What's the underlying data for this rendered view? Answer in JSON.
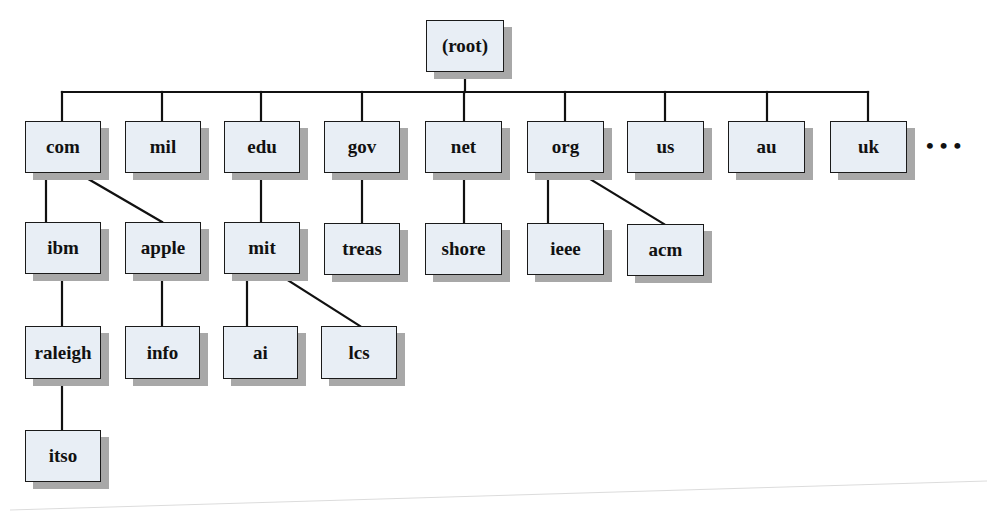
{
  "diagram": {
    "ellipsis": "•••",
    "colors": {
      "box_fill": "#e8eef5",
      "box_border": "#1a1a1a",
      "shadow": "#a8a8a8",
      "line": "#111111"
    },
    "nodes": [
      {
        "id": "root",
        "label": "(root)",
        "x": 426,
        "y": 20,
        "w": 78,
        "h": 52
      },
      {
        "id": "com",
        "label": "com",
        "x": 25,
        "y": 121,
        "w": 76,
        "h": 52
      },
      {
        "id": "mil",
        "label": "mil",
        "x": 125,
        "y": 121,
        "w": 76,
        "h": 52
      },
      {
        "id": "edu",
        "label": "edu",
        "x": 224,
        "y": 121,
        "w": 76,
        "h": 52
      },
      {
        "id": "gov",
        "label": "gov",
        "x": 324,
        "y": 121,
        "w": 76,
        "h": 52
      },
      {
        "id": "net",
        "label": "net",
        "x": 425,
        "y": 121,
        "w": 77,
        "h": 52
      },
      {
        "id": "org",
        "label": "org",
        "x": 527,
        "y": 121,
        "w": 77,
        "h": 52
      },
      {
        "id": "us",
        "label": "us",
        "x": 627,
        "y": 121,
        "w": 77,
        "h": 52
      },
      {
        "id": "au",
        "label": "au",
        "x": 728,
        "y": 121,
        "w": 77,
        "h": 52
      },
      {
        "id": "uk",
        "label": "uk",
        "x": 830,
        "y": 121,
        "w": 77,
        "h": 52
      },
      {
        "id": "ibm",
        "label": "ibm",
        "x": 25,
        "y": 222,
        "w": 76,
        "h": 52
      },
      {
        "id": "apple",
        "label": "apple",
        "x": 125,
        "y": 222,
        "w": 76,
        "h": 52
      },
      {
        "id": "mit",
        "label": "mit",
        "x": 224,
        "y": 222,
        "w": 76,
        "h": 52
      },
      {
        "id": "treas",
        "label": "treas",
        "x": 324,
        "y": 223,
        "w": 76,
        "h": 52
      },
      {
        "id": "shore",
        "label": "shore",
        "x": 425,
        "y": 223,
        "w": 77,
        "h": 52
      },
      {
        "id": "ieee",
        "label": "ieee",
        "x": 527,
        "y": 223,
        "w": 77,
        "h": 52
      },
      {
        "id": "acm",
        "label": "acm",
        "x": 627,
        "y": 224,
        "w": 77,
        "h": 52
      },
      {
        "id": "raleigh",
        "label": "raleigh",
        "x": 25,
        "y": 326,
        "w": 76,
        "h": 53
      },
      {
        "id": "info",
        "label": "info",
        "x": 125,
        "y": 326,
        "w": 75,
        "h": 53
      },
      {
        "id": "ai",
        "label": "ai",
        "x": 223,
        "y": 326,
        "w": 75,
        "h": 53
      },
      {
        "id": "lcs",
        "label": "lcs",
        "x": 321,
        "y": 326,
        "w": 76,
        "h": 53
      },
      {
        "id": "itso",
        "label": "itso",
        "x": 25,
        "y": 430,
        "w": 76,
        "h": 52
      }
    ],
    "edges": [
      {
        "from": "root",
        "type": "bus",
        "bus_y": 92,
        "x1": 62,
        "x2": 868,
        "drop_from_x": 465,
        "drop_from_y": 72
      },
      {
        "type": "line",
        "x1": 62,
        "y1": 92,
        "x2": 62,
        "y2": 121
      },
      {
        "type": "line",
        "x1": 162,
        "y1": 92,
        "x2": 162,
        "y2": 121
      },
      {
        "type": "line",
        "x1": 261,
        "y1": 92,
        "x2": 261,
        "y2": 121
      },
      {
        "type": "line",
        "x1": 362,
        "y1": 92,
        "x2": 362,
        "y2": 121
      },
      {
        "type": "line",
        "x1": 464,
        "y1": 92,
        "x2": 464,
        "y2": 121
      },
      {
        "type": "line",
        "x1": 565,
        "y1": 92,
        "x2": 565,
        "y2": 121
      },
      {
        "type": "line",
        "x1": 665,
        "y1": 92,
        "x2": 665,
        "y2": 121
      },
      {
        "type": "line",
        "x1": 767,
        "y1": 92,
        "x2": 767,
        "y2": 121
      },
      {
        "type": "line",
        "x1": 868,
        "y1": 92,
        "x2": 868,
        "y2": 121
      },
      {
        "type": "line",
        "from": "com",
        "to": "ibm",
        "x1": 46,
        "y1": 173,
        "x2": 46,
        "y2": 222
      },
      {
        "type": "line",
        "from": "com",
        "to": "apple",
        "x1": 78,
        "y1": 173,
        "x2": 162,
        "y2": 222
      },
      {
        "type": "line",
        "from": "edu",
        "to": "mit",
        "x1": 261,
        "y1": 173,
        "x2": 261,
        "y2": 222
      },
      {
        "type": "line",
        "from": "gov",
        "to": "treas",
        "x1": 362,
        "y1": 173,
        "x2": 362,
        "y2": 223
      },
      {
        "type": "line",
        "from": "net",
        "to": "shore",
        "x1": 464,
        "y1": 173,
        "x2": 464,
        "y2": 223
      },
      {
        "type": "line",
        "from": "org",
        "to": "ieee",
        "x1": 548,
        "y1": 173,
        "x2": 548,
        "y2": 223
      },
      {
        "type": "line",
        "from": "org",
        "to": "acm",
        "x1": 580,
        "y1": 173,
        "x2": 664,
        "y2": 224
      },
      {
        "type": "line",
        "from": "ibm",
        "to": "raleigh",
        "x1": 62,
        "y1": 274,
        "x2": 62,
        "y2": 326
      },
      {
        "type": "line",
        "from": "apple",
        "to": "info",
        "x1": 162,
        "y1": 274,
        "x2": 162,
        "y2": 326
      },
      {
        "type": "line",
        "from": "mit",
        "to": "ai",
        "x1": 247,
        "y1": 274,
        "x2": 247,
        "y2": 326
      },
      {
        "type": "line",
        "from": "mit",
        "to": "lcs",
        "x1": 278,
        "y1": 274,
        "x2": 360,
        "y2": 326
      },
      {
        "type": "line",
        "from": "raleigh",
        "to": "itso",
        "x1": 62,
        "y1": 379,
        "x2": 62,
        "y2": 430
      }
    ]
  }
}
